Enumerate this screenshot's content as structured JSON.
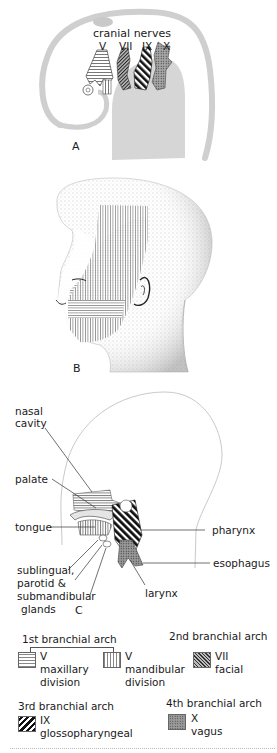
{
  "figure": {
    "panels": {
      "A": {
        "letter": "A",
        "title": "cranial nerves",
        "nerve_labels": [
          "V",
          "VII",
          "IX",
          "X"
        ]
      },
      "B": {
        "letter": "B"
      },
      "C": {
        "letter": "C",
        "labels": {
          "nasal_cavity_1": "nasal",
          "nasal_cavity_2": "cavity",
          "palate": "palate",
          "tongue": "tongue",
          "pharynx": "pharynx",
          "esophagus": "esophagus",
          "larynx": "larynx",
          "glands_1": "sublingual,",
          "glands_2": "parotid &",
          "glands_3": "submandibular",
          "glands_4": "glands"
        }
      }
    },
    "legend": {
      "arch1": {
        "heading": "1st branchial arch",
        "items": [
          {
            "nerve": "V",
            "name": "maxillary",
            "name2": "division",
            "pattern": "horizontal-lines"
          },
          {
            "nerve": "V",
            "name": "mandibular",
            "name2": "division",
            "pattern": "vertical-lines"
          }
        ]
      },
      "arch2": {
        "heading": "2nd branchial arch",
        "item": {
          "nerve": "VII",
          "name": "facial",
          "pattern": "fine-diagonal"
        }
      },
      "arch3": {
        "heading": "3rd branchial arch",
        "item": {
          "nerve": "IX",
          "name": "glossopharyngeal",
          "pattern": "bold-diagonal"
        }
      },
      "arch4": {
        "heading": "4th branchial arch",
        "item": {
          "nerve": "X",
          "name": "vagus",
          "pattern": "stipple"
        }
      }
    },
    "colors": {
      "outline": "#b5b5b5",
      "shaded": "#d4d4d4",
      "ink": "#1a1a1a"
    }
  }
}
